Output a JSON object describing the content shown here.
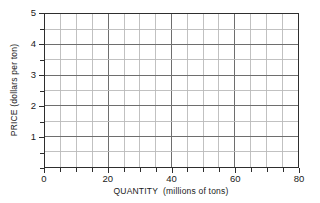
{
  "chart_data": {
    "type": "line",
    "title": "",
    "subtitle": "",
    "xlabel": "QUANTITY  (millions of tons)",
    "ylabel": "PRICE (dollars per ton)",
    "xlim": [
      0,
      80
    ],
    "ylim": [
      0,
      5
    ],
    "grid": true,
    "grid_on": "both",
    "legend": null,
    "legend_position": "none",
    "series": [],
    "x": [],
    "values": [],
    "annotations": [],
    "x_major_ticks": [
      0,
      20,
      40,
      60,
      80
    ],
    "x_minor_ticks": [
      5,
      10,
      15,
      25,
      30,
      35,
      45,
      50,
      55,
      65,
      70,
      75
    ],
    "x_tick_step": 5,
    "x_tick_labels": [
      "0",
      "20",
      "40",
      "60",
      "80"
    ],
    "y_major_ticks": [
      1,
      2,
      3,
      4,
      5
    ],
    "y_minor_ticks": [
      0.5,
      1.5,
      2.5,
      3.5,
      4.5
    ],
    "y_tick_step": 0.5,
    "y_tick_labels": [
      "1",
      "2",
      "3",
      "4",
      "5"
    ],
    "colors": {
      "background": "#ffffff",
      "frame": "#2e2e2e",
      "grid_major": "#6e6e6e",
      "grid_minor": "#b9b9b9",
      "text": "#1a1a1a"
    }
  }
}
